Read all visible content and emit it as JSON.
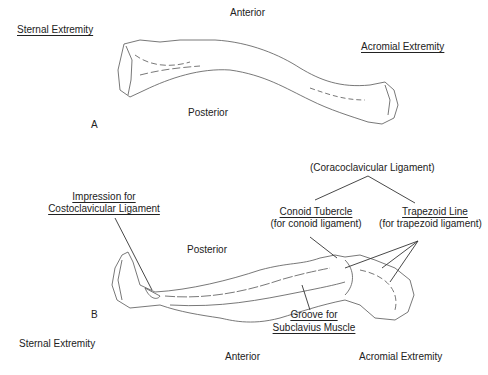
{
  "figure_a": {
    "panel_label": "A",
    "labels": {
      "anterior": "Anterior",
      "posterior": "Posterior",
      "sternal_extremity": "Sternal Extremity",
      "acromial_extremity": "Acromial Extremity"
    }
  },
  "figure_b": {
    "panel_label": "B",
    "labels": {
      "posterior": "Posterior",
      "anterior": "Anterior",
      "sternal_extremity": "Sternal Extremity",
      "acromial_extremity": "Acromial Extremity",
      "coracoclavicular": "(Coracoclavicular Ligament)",
      "conoid_title": "Conoid Tubercle",
      "conoid_sub": "(for conoid ligament)",
      "trapezoid_title": "Trapezoid Line",
      "trapezoid_sub": "(for trapezoid ligament)",
      "impression_line1": "Impression for",
      "impression_line2": "Costoclavicular Ligament",
      "groove_line1": "Groove for",
      "groove_line2": "Subclavius Muscle"
    }
  },
  "colors": {
    "line": "#333333",
    "bone_stroke": "#555555",
    "background": "#ffffff"
  }
}
